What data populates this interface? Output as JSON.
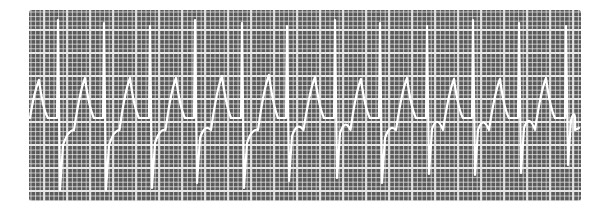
{
  "figure": {
    "background_color": "#ffffff",
    "paper_color": "#5a5a5a",
    "grid_color": "#e8e8e8",
    "trace_color": "#ffffff"
  },
  "grid": {
    "x0": 29,
    "y0": 10,
    "x1": 581,
    "y1": 201,
    "minor_step": 4.6,
    "major_every": 5,
    "major_x_offset": 67,
    "major_y_offset": 30
  },
  "trace": {
    "baseline_y": 120,
    "start": [
      30,
      118
    ],
    "beats": [
      {
        "spike_x": 59,
        "peak_x": 39,
        "peak_y": 80,
        "trough_y": 190
      },
      {
        "spike_x": 105,
        "peak_x": 85,
        "peak_y": 78,
        "trough_y": 190
      },
      {
        "spike_x": 151,
        "peak_x": 130,
        "peak_y": 78,
        "trough_y": 188
      },
      {
        "spike_x": 196,
        "peak_x": 176,
        "peak_y": 78,
        "trough_y": 183
      },
      {
        "spike_x": 243,
        "peak_x": 222,
        "peak_y": 76,
        "trough_y": 188
      },
      {
        "spike_x": 288,
        "peak_x": 269,
        "peak_y": 75,
        "trough_y": 181
      },
      {
        "spike_x": 336,
        "peak_x": 315,
        "peak_y": 77,
        "trough_y": 178
      },
      {
        "spike_x": 381,
        "peak_x": 361,
        "peak_y": 79,
        "trough_y": 183
      },
      {
        "spike_x": 428,
        "peak_x": 407,
        "peak_y": 78,
        "trough_y": 174
      },
      {
        "spike_x": 474,
        "peak_x": 454,
        "peak_y": 79,
        "trough_y": 175
      },
      {
        "spike_x": 520,
        "peak_x": 500,
        "peak_y": 79,
        "trough_y": 173
      },
      {
        "spike_x": 567,
        "peak_x": 546,
        "peak_y": 78,
        "trough_y": 165
      }
    ],
    "spike_top_y": 20,
    "end": [
      579,
      128
    ]
  }
}
